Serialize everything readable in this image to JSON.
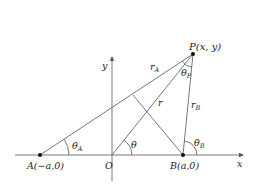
{
  "diagram": {
    "type": "geometry",
    "axes": {
      "x_label": "x",
      "y_label": "y",
      "origin_label": "O"
    },
    "points": {
      "A": "A(−a,0)",
      "B": "B(a,0)",
      "P": "P(x, y)"
    },
    "segments": {
      "rA": "r",
      "rA_sub": "A",
      "rB": "r",
      "rB_sub": "B",
      "r": "r"
    },
    "angles": {
      "theta": "θ",
      "thetaA": "θ",
      "thetaA_sub": "A",
      "thetaB": "θ",
      "thetaB_sub": "B",
      "thetaP": "θ",
      "thetaP_sub": "P"
    },
    "colors": {
      "line": "#555555",
      "text": "#222222",
      "point": "#111111"
    }
  }
}
